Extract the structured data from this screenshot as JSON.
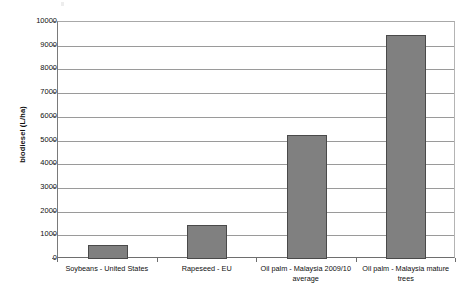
{
  "chart_data": {
    "type": "bar",
    "title": "",
    "subtitle": "",
    "xlabel": "",
    "ylabel": "biodiesel (L/ha)",
    "categories": [
      "Soybeans - United States",
      "Rapeseed - EU",
      "Oil palm - Malaysia 2009/10 average",
      "Oil palm - Malaysia mature trees"
    ],
    "values": [
      590,
      1430,
      5230,
      9460
    ],
    "ylim": [
      0,
      10000
    ],
    "ytick_labels": [
      "0",
      "1000",
      "2000",
      "3000",
      "4000",
      "5000",
      "6000",
      "7000",
      "8000",
      "9000",
      "10000"
    ],
    "ytick_values": [
      0,
      1000,
      2000,
      3000,
      4000,
      5000,
      6000,
      7000,
      8000,
      9000,
      10000
    ],
    "grid": true,
    "grid_axis": "y",
    "legend": false,
    "legend_position": "none",
    "bar_color": "#808080",
    "bar_border_color": "#4a4a4a",
    "gridline_color": "#9a9a9a",
    "axis_color": "#6e6e6e",
    "plot_background": "#ffffff"
  }
}
